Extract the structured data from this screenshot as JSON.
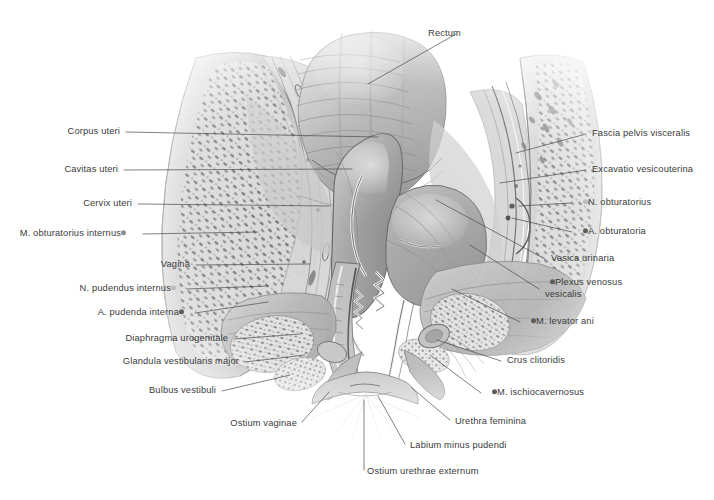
{
  "plate": {
    "title": "Median sagittal section of the female pelvis",
    "background_color": "#ffffff",
    "label_color": "#3a3a3a",
    "leader_color": "#4a4a4a"
  },
  "labels": [
    {
      "id": "rectum",
      "text": "Rectum",
      "side": "left-anchor",
      "bullet": "none",
      "x": 461,
      "y": 34,
      "line": [
        [
          456,
          34
        ],
        [
          368,
          84
        ]
      ]
    },
    {
      "id": "fascia-pelvis-visceralis",
      "text": "Fascia pelvis visceralis",
      "side": "right",
      "bullet": "none",
      "x": 592,
      "y": 134,
      "line": [
        [
          586,
          134
        ],
        [
          516,
          153
        ]
      ]
    },
    {
      "id": "excavatio-vesicouterina",
      "text": "Excavatio vesicouterina",
      "side": "right",
      "bullet": "none",
      "x": 592,
      "y": 170,
      "line": [
        [
          586,
          170
        ],
        [
          500,
          183
        ]
      ]
    },
    {
      "id": "n-obturatorius",
      "text": "N. obturatorius",
      "side": "right",
      "bullet": "light",
      "x": 578,
      "y": 203,
      "line": [
        [
          572,
          203
        ],
        [
          519,
          206
        ]
      ]
    },
    {
      "id": "a-obturatoria",
      "text": "A. obturatoria",
      "side": "right",
      "bullet": "dark",
      "x": 578,
      "y": 232,
      "line": [
        [
          572,
          232
        ],
        [
          512,
          218
        ]
      ]
    },
    {
      "id": "vesica-urinaria",
      "text": "Vesica urinaria",
      "side": "right",
      "bullet": "none",
      "x": 551,
      "y": 259,
      "line": [
        [
          545,
          259
        ],
        [
          436,
          200
        ]
      ]
    },
    {
      "id": "plexus-venosus-vesicalis",
      "text": "Plexus venosus vesicalis",
      "side": "right",
      "bullet": "dark",
      "x": 545,
      "y": 289,
      "line": [
        [
          539,
          289
        ],
        [
          470,
          245
        ]
      ],
      "two_line": true
    },
    {
      "id": "m-levator-ani",
      "text": "M. levator ani",
      "side": "right",
      "bullet": "dark",
      "x": 526,
      "y": 322,
      "line": [
        [
          520,
          322
        ],
        [
          452,
          289
        ]
      ]
    },
    {
      "id": "crus-clitoridis",
      "text": "Crus clitoridis",
      "side": "right",
      "bullet": "none",
      "x": 507,
      "y": 361,
      "line": [
        [
          501,
          361
        ],
        [
          437,
          340
        ]
      ]
    },
    {
      "id": "m-ischiocavernosus",
      "text": "M. ischiocavernosus",
      "side": "right",
      "bullet": "dark",
      "x": 487,
      "y": 393,
      "line": [
        [
          481,
          393
        ],
        [
          430,
          355
        ]
      ]
    },
    {
      "id": "urethra-feminina",
      "text": "Urethra feminina",
      "side": "right",
      "bullet": "none",
      "x": 455,
      "y": 422,
      "line": [
        [
          450,
          420
        ],
        [
          412,
          388
        ]
      ]
    },
    {
      "id": "labium-minus-pudendi",
      "text": "Labium minus pudendi",
      "side": "right",
      "bullet": "none",
      "x": 410,
      "y": 446,
      "line": [
        [
          405,
          444
        ],
        [
          378,
          396
        ]
      ]
    },
    {
      "id": "ostium-urethrae-externum",
      "text": "Ostium urethrae externum",
      "side": "right",
      "bullet": "none",
      "x": 367,
      "y": 472,
      "line": [
        [
          364,
          470
        ],
        [
          364,
          400
        ]
      ]
    },
    {
      "id": "ostium-vaginae",
      "text": "Ostium vaginae",
      "side": "left",
      "bullet": "none",
      "x": 297,
      "y": 424,
      "line": [
        [
          302,
          422
        ],
        [
          329,
          392
        ]
      ]
    },
    {
      "id": "bulbus-vestibuli",
      "text": "Bulbus vestibuli",
      "side": "left",
      "bullet": "none",
      "x": 216,
      "y": 391,
      "line": [
        [
          222,
          391
        ],
        [
          290,
          375
        ]
      ]
    },
    {
      "id": "glandula-vestibularis",
      "text": "Glandula vestibularis major",
      "side": "left",
      "bullet": "none",
      "x": 239,
      "y": 362,
      "line": [
        [
          245,
          362
        ],
        [
          305,
          355
        ]
      ]
    },
    {
      "id": "diaphragma-urogenitale",
      "text": "Diaphragma urogenitale",
      "side": "left",
      "bullet": "none",
      "x": 228,
      "y": 339,
      "line": [
        [
          234,
          339
        ],
        [
          300,
          334
        ]
      ]
    },
    {
      "id": "a-pudenda-interna",
      "text": "A. pudenda interna",
      "side": "left",
      "bullet": "dark",
      "x": 189,
      "y": 313,
      "line": [
        [
          195,
          313
        ],
        [
          268,
          302
        ]
      ]
    },
    {
      "id": "n-pudendus-internus",
      "text": "N. pudendus internus",
      "side": "left",
      "bullet": "light",
      "x": 181,
      "y": 289,
      "line": [
        [
          187,
          289
        ],
        [
          268,
          286
        ]
      ]
    },
    {
      "id": "vagina",
      "text": "Vagina",
      "side": "left",
      "bullet": "none",
      "x": 190,
      "y": 265,
      "line": [
        [
          196,
          265
        ],
        [
          310,
          264
        ]
      ]
    },
    {
      "id": "m-obturatorius-internus",
      "text": "M. obturatorius internus",
      "side": "left",
      "bullet": "mid",
      "x": 131,
      "y": 234,
      "line": [
        [
          143,
          234
        ],
        [
          258,
          232
        ]
      ]
    },
    {
      "id": "cervix-uteri",
      "text": "Cervix uteri",
      "side": "left",
      "bullet": "none",
      "x": 132,
      "y": 204,
      "line": [
        [
          138,
          204
        ],
        [
          330,
          206
        ]
      ]
    },
    {
      "id": "cavitas-uteri",
      "text": "Cavitas uteri",
      "side": "left",
      "bullet": "none",
      "x": 118,
      "y": 170,
      "line": [
        [
          124,
          170
        ],
        [
          352,
          169
        ]
      ]
    },
    {
      "id": "corpus-uteri",
      "text": "Corpus uteri",
      "side": "left",
      "bullet": "none",
      "x": 120,
      "y": 132,
      "line": [
        [
          126,
          132
        ],
        [
          378,
          137
        ]
      ]
    }
  ]
}
